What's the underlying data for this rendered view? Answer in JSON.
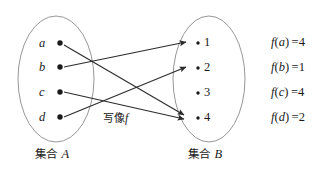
{
  "figure": {
    "background_color": "#ffffff",
    "stroke_color": "#3a3a3a",
    "text_color": "#1a1a1a",
    "map_label": "写像",
    "map_label_symbol": "f"
  },
  "set_a": {
    "label_prefix": "集合",
    "label_name": "A",
    "elements": [
      {
        "name": "a"
      },
      {
        "name": "b"
      },
      {
        "name": "c"
      },
      {
        "name": "d"
      }
    ]
  },
  "set_b": {
    "label_prefix": "集合",
    "label_name": "B",
    "elements": [
      {
        "name": "1"
      },
      {
        "name": "2"
      },
      {
        "name": "3"
      },
      {
        "name": "4"
      }
    ]
  },
  "mappings": [
    {
      "from": "a",
      "to": "4"
    },
    {
      "from": "b",
      "to": "1"
    },
    {
      "from": "c",
      "to": "4"
    },
    {
      "from": "d",
      "to": "2"
    }
  ],
  "function_values": [
    {
      "symbol": "f",
      "arg": "a",
      "eq": "=",
      "value": "4"
    },
    {
      "symbol": "f",
      "arg": "b",
      "eq": "=",
      "value": "1"
    },
    {
      "symbol": "f",
      "arg": "c",
      "eq": "=",
      "value": "4"
    },
    {
      "symbol": "f",
      "arg": "d",
      "eq": "=",
      "value": "2"
    }
  ]
}
